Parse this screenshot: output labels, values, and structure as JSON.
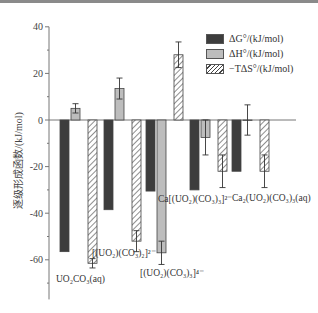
{
  "chart_data": {
    "type": "bar",
    "title": "",
    "xlabel": "",
    "ylabel": "逐级形成函数/(kJ/mol)",
    "ylim": [
      -77,
      40
    ],
    "yticks": [
      40,
      20,
      0,
      -20,
      -40,
      -60
    ],
    "grid": false,
    "legend_position": "upper right",
    "categories": [
      "UO2CO3(aq)",
      "[(UO2)(CO3)2]2-",
      "[(UO2)(CO3)3]4-",
      "Ca[(UO2)(CO3)3]2-",
      "Ca2(UO2)(CO3)3(aq)"
    ],
    "category_labels_display": [
      {
        "base": "UO",
        "sub1": "2",
        "mid": "CO",
        "sub2": "3",
        "tail": "(aq)"
      },
      {
        "text": "[(UO₂)(CO₃)₂]²⁻"
      },
      {
        "text": "[(UO₂)(CO₃)₃]⁴⁻"
      },
      {
        "text": "Ca[(UO₂)(CO₃)₃]²⁻"
      },
      {
        "text": "Ca₂(UO₂)(CO₃)₃(aq)"
      }
    ],
    "series": [
      {
        "name": "ΔG°/(kJ/mol)",
        "pattern": "dark",
        "color": "#3d3d3d",
        "values": [
          -56.5,
          -38.5,
          -30.5,
          -30,
          -22
        ],
        "errors": [
          0,
          0,
          0,
          0,
          0
        ]
      },
      {
        "name": "ΔH°/(kJ/mol)",
        "pattern": "light",
        "color": "#bdbdbd",
        "values": [
          5,
          13.5,
          -57,
          -7.5,
          0
        ],
        "errors": [
          2,
          4.5,
          5,
          7.5,
          6.5
        ]
      },
      {
        "name": "−TΔS°/(kJ/mol)",
        "pattern": "hatch",
        "color": "#ffffff",
        "values": [
          -61.5,
          -52,
          28,
          -22,
          -22
        ],
        "errors": [
          2,
          4.5,
          5.5,
          7,
          7
        ]
      }
    ]
  },
  "legend": {
    "items": [
      "ΔG°/(kJ/mol)",
      "ΔH°/(kJ/mol)",
      "−TΔS°/(kJ/mol)"
    ]
  },
  "labels": {
    "ylabel": "逐级形成函数/(kJ/mol)",
    "cat0": "UO₂CO₃(aq)",
    "cat1": "[(UO₂)(CO₃)₂]²⁻",
    "cat2": "[(UO₂)(CO₃)₃]⁴⁻",
    "cat3": "Ca[(UO₂)(CO₃)₃]²⁻",
    "cat4": "Ca₂(UO₂)(CO₃)₃(aq)"
  }
}
